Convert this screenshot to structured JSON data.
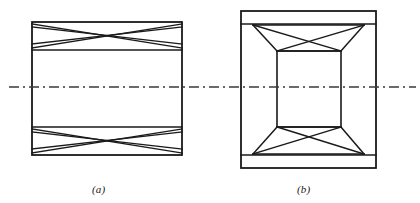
{
  "figure": {
    "background_color": "#ffffff",
    "stroke_color": "#1a1a1a",
    "centerline_color": "#3a3a3a",
    "line_width": 1.4,
    "outline_width": 1.8,
    "captions": {
      "a": "(a)",
      "b": "(b)"
    },
    "centerline": {
      "name": "horizontal-axis-centerline",
      "style": "dash-dot",
      "y": 87,
      "x_start": 9,
      "x_end": 416,
      "dash_pattern": "10 4 2 4"
    },
    "panel_a": {
      "label": "(a)",
      "description": "Rectangular box girder elevation with cross-braced top and bottom bands",
      "outer_rect": {
        "x": 32,
        "y": 22,
        "width": 150,
        "height": 133
      },
      "band_top": {
        "y_top": 22,
        "y_bottom": 50
      },
      "band_bottom": {
        "y_top": 127,
        "y_bottom": 155
      },
      "bracing": "double-x-cross-in-each-band"
    },
    "panel_b": {
      "label": "(b)",
      "description": "Box girder plan with tapered trapezoidal end bays, cross-braced, and central rectangular cell",
      "outer_rect": {
        "x": 241,
        "y": 11,
        "width": 135,
        "height": 157
      },
      "strip_top": {
        "y_top": 11,
        "y_bottom": 24
      },
      "strip_bottom": {
        "y_top": 155,
        "y_bottom": 168
      },
      "inner_rect": {
        "x": 277,
        "y": 51,
        "width": 64,
        "height": 76
      },
      "bracing": "trapezoidal-bay-with-x-cross-top-and-bottom"
    }
  }
}
